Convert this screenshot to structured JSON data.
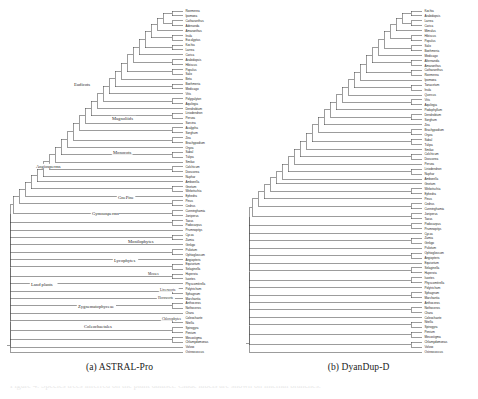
{
  "figure": {
    "kind": "phylogenetic-cladogram-comparison",
    "bottom_caption": "Figure 4: Species trees inferred on the plant dataset. Clade labels are shown on internal branches."
  },
  "panels": [
    {
      "id": "a",
      "caption": "(a) ASTRAL-Pro",
      "clade_labels": [
        "Eudicots",
        "Magnoliids",
        "Monocots",
        "Angiosperms",
        "GnePine",
        "Gymnosperms",
        "Monilophytes",
        "Lycophytes",
        "Mosses",
        "Liverworts",
        "Hornworts",
        "Land plants",
        "Zygnematophyceae",
        "Coleochaetales",
        "Chlorophytes"
      ],
      "tips": [
        "Roemerea",
        "Ipomoea",
        "Catharanthus",
        "Adenanda",
        "Amaranthus",
        "Inula",
        "Eucalyptus",
        "Kochia",
        "Larrea",
        "Carica",
        "Arabidopsis",
        "Hibiscus",
        "Populus",
        "Salix",
        "Beta",
        "Boehmeria",
        "Medicago",
        "Vitis",
        "Polygalyton",
        "Aquilegia",
        "Dendrobium",
        "Liriodendron",
        "Persea",
        "Sarcina",
        "Acalypha",
        "Sorghum",
        "Zea",
        "Brachypodium",
        "Oryza",
        "Sabal",
        "Tulipa",
        "Smilax",
        "Colchicum",
        "Dioscorea",
        "Nuphar",
        "Amborella",
        "Gnetum",
        "Welwitschia",
        "Ephedra",
        "Pinus",
        "Cedrus",
        "Cunninghamia",
        "Juniperus",
        "Taxus",
        "Podocarpus",
        "Prumnopitys",
        "Cycas",
        "Zamia",
        "Ginkgo",
        "Psilotum",
        "Ophioglossum",
        "Angiopteris",
        "Equisetum",
        "Selaginella",
        "Huperzia",
        "Isoetes",
        "Physcomitrella",
        "Polytrichum",
        "Sphagnum",
        "Marchantia",
        "Anthoceros",
        "Nothoceros",
        "Chara",
        "Coleochaete",
        "Nitella",
        "Spirogyra",
        "Penium",
        "Mesostigma",
        "Chlamydomonas",
        "Volvox",
        "Ostreococcus"
      ]
    },
    {
      "id": "b",
      "caption": "(b) DyanDup-D",
      "clade_labels": [],
      "tips": [
        "Kochia",
        "Arabidopsis",
        "Larrea",
        "Carica",
        "Mimulus",
        "Hibiscus",
        "Populus",
        "Salix",
        "Boehmeria",
        "Medicago",
        "Alternanda",
        "Amaranthus",
        "Catharanthus",
        "Roemerea",
        "Ipomoea",
        "Tanacetum",
        "Inula",
        "Quercus",
        "Vitis",
        "Aquilegia",
        "Podophyllum",
        "Dendrobium",
        "Sorghum",
        "Zea",
        "Brachypodium",
        "Oryza",
        "Sabal",
        "Tulipa",
        "Smilax",
        "Colchicum",
        "Dioscorea",
        "Persea",
        "Liriodendron",
        "Nuphar",
        "Amborella",
        "Gnetum",
        "Welwitschia",
        "Ephedra",
        "Pinus",
        "Cedrus",
        "Cunninghamia",
        "Juniperus",
        "Taxus",
        "Podocarpus",
        "Prumnopitys",
        "Cycas",
        "Zamia",
        "Ginkgo",
        "Psilotum",
        "Ophioglossum",
        "Angiopteris",
        "Equisetum",
        "Selaginella",
        "Huperzia",
        "Isoetes",
        "Physcomitrella",
        "Polytrichum",
        "Sphagnum",
        "Marchantia",
        "Anthoceros",
        "Nothoceros",
        "Chara",
        "Coleochaete",
        "Nitella",
        "Spirogyra",
        "Penium",
        "Mesostigma",
        "Chlamydomonas",
        "Volvox",
        "Ostreococcus"
      ]
    }
  ],
  "style": {
    "branch_color": "#4a4a4a",
    "text_color": "#262626",
    "background": "#ffffff"
  }
}
